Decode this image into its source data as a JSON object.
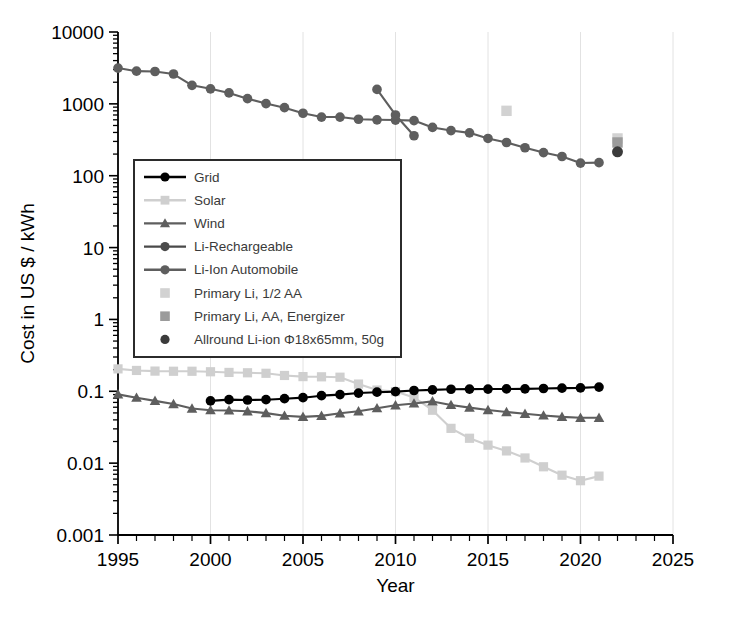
{
  "chart_data": {
    "type": "line",
    "title": "",
    "xlabel": "Year",
    "ylabel": "Cost in US $ / kWh",
    "xlim": [
      1995,
      2025
    ],
    "ylim": [
      0.001,
      10000
    ],
    "yscale": "log",
    "xscale": "linear",
    "grid": true,
    "legend_position": "upper-left-inside",
    "x_ticks": [
      "1995",
      "2000",
      "2005",
      "2010",
      "2015",
      "2020",
      "2025"
    ],
    "y_ticks": [
      "10000",
      "1000",
      "100",
      "10",
      "1",
      "0.1",
      "0.01",
      "0.001"
    ],
    "series": [
      {
        "name": "Grid",
        "marker": "circle",
        "color": "#000000",
        "x": [
          2000,
          2001,
          2002,
          2003,
          2004,
          2005,
          2006,
          2007,
          2008,
          2009,
          2010,
          2011,
          2012,
          2013,
          2014,
          2015,
          2016,
          2017,
          2018,
          2019,
          2020,
          2021
        ],
        "y": [
          0.0735,
          0.0765,
          0.0757,
          0.0764,
          0.0789,
          0.0815,
          0.0869,
          0.0899,
          0.0945,
          0.0971,
          0.0989,
          0.1025,
          0.1045,
          0.1067,
          0.1072,
          0.1074,
          0.1078,
          0.1081,
          0.1093,
          0.1105,
          0.1115,
          0.1145
        ]
      },
      {
        "name": "Solar",
        "marker": "square",
        "color": "#cfcfcf",
        "x": [
          1995,
          1996,
          1997,
          1998,
          1999,
          2000,
          2001,
          2002,
          2003,
          2004,
          2005,
          2006,
          2007,
          2008,
          2009,
          2010,
          2011,
          2012,
          2013,
          2014,
          2015,
          2016,
          2017,
          2018,
          2019,
          2020,
          2021
        ],
        "y": [
          0.205,
          0.195,
          0.191,
          0.19,
          0.19,
          0.187,
          0.183,
          0.181,
          0.178,
          0.166,
          0.16,
          0.159,
          0.157,
          0.126,
          0.104,
          0.099,
          0.082,
          0.0545,
          0.0305,
          0.0222,
          0.0178,
          0.0148,
          0.0118,
          0.0089,
          0.0068,
          0.0057,
          0.0066
        ]
      },
      {
        "name": "Wind",
        "marker": "triangle",
        "color": "#5e5e5e",
        "x": [
          1995,
          1996,
          1997,
          1998,
          1999,
          2000,
          2001,
          2002,
          2003,
          2004,
          2005,
          2006,
          2007,
          2008,
          2009,
          2010,
          2011,
          2012,
          2013,
          2014,
          2015,
          2016,
          2017,
          2018,
          2019,
          2020,
          2021
        ],
        "y": [
          0.0905,
          0.0815,
          0.0735,
          0.0665,
          0.0575,
          0.0545,
          0.0541,
          0.0527,
          0.0497,
          0.0457,
          0.0441,
          0.0455,
          0.0494,
          0.0526,
          0.0581,
          0.0639,
          0.0677,
          0.0723,
          0.0646,
          0.0592,
          0.0549,
          0.0515,
          0.0487,
          0.0461,
          0.0441,
          0.0428,
          0.0428
        ]
      },
      {
        "name": "Li-Rechargeable",
        "marker": "circle",
        "color": "#5e5e5e",
        "x": [
          1995,
          1996,
          1997,
          1998,
          1999,
          2000,
          2001,
          2002,
          2003,
          2004,
          2005,
          2006,
          2007,
          2008,
          2009,
          2010,
          2011,
          2012,
          2013,
          2014,
          2015,
          2016,
          2017,
          2018,
          2019,
          2020,
          2021
        ],
        "y": [
          3150,
          2850,
          2820,
          2600,
          1810,
          1620,
          1420,
          1180,
          1010,
          885,
          740,
          655,
          655,
          610,
          600,
          595,
          585,
          470,
          425,
          395,
          330,
          290,
          245,
          210,
          185,
          150,
          152
        ]
      },
      {
        "name": "Li-Ion Automobile",
        "marker": "circle",
        "color": "#5e5e5e",
        "x": [
          2009,
          2010,
          2011
        ],
        "y": [
          1590,
          700,
          360
        ]
      },
      {
        "name": "Primary Li, 1/2 AA",
        "marker": "square-only",
        "color": "#d2d2d2",
        "x": [
          2016,
          2022
        ],
        "y": [
          800,
          330
        ]
      },
      {
        "name": "Primary Li, AA, Energizer",
        "marker": "square-only",
        "color": "#9b9b9b",
        "x": [
          2022
        ],
        "y": [
          290
        ]
      },
      {
        "name": "Allround Li-ion Φ18x65mm, 50g",
        "marker": "circle-only",
        "color": "#3b3b3b",
        "x": [
          2022
        ],
        "y": [
          215
        ]
      }
    ]
  },
  "legend": {
    "items": [
      {
        "label": "Grid",
        "style": "line-circle",
        "color": "#000000"
      },
      {
        "label": "Solar",
        "style": "line-square",
        "color": "#cfcfcf"
      },
      {
        "label": "Wind",
        "style": "line-triangle",
        "color": "#5e5e5e"
      },
      {
        "label": "Li-Rechargeable",
        "style": "line-circle",
        "color": "#4a4a4a"
      },
      {
        "label": "Li-Ion Automobile",
        "style": "line-circle",
        "color": "#5e5e5e"
      },
      {
        "label": "Primary Li, 1/2 AA",
        "style": "square",
        "color": "#d2d2d2"
      },
      {
        "label": "Primary Li, AA, Energizer",
        "style": "square",
        "color": "#9b9b9b"
      },
      {
        "label": "Allround Li-ion Φ18x65mm, 50g",
        "style": "circle",
        "color": "#3b3b3b"
      }
    ]
  },
  "axes": {
    "x_title": "Year",
    "y_title": "Cost in US $ / kWh"
  },
  "colors": {
    "axis": "#000000",
    "grid": "#e2e2e2",
    "background": "#ffffff"
  }
}
